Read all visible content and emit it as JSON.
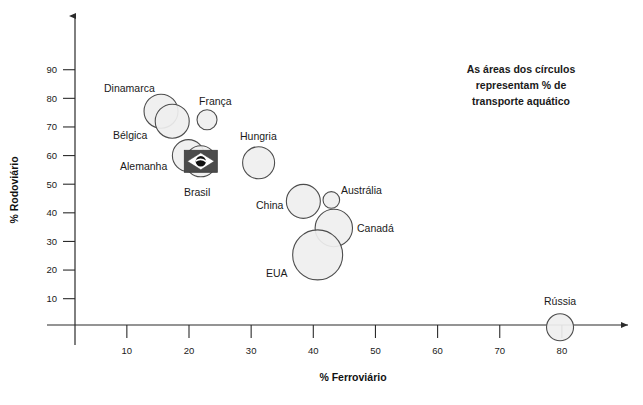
{
  "chart_data": {
    "type": "scatter",
    "title": "",
    "xlabel": "% Ferroviário",
    "ylabel": "% Rodoviário",
    "xlim": [
      0,
      85
    ],
    "ylim": [
      0,
      98
    ],
    "xticks": [
      10,
      20,
      30,
      40,
      50,
      60,
      70,
      80
    ],
    "yticks": [
      10,
      20,
      30,
      40,
      50,
      60,
      70,
      80,
      90
    ],
    "grid": false,
    "legend": "none",
    "annotation": "As áreas dos círculos representam % de transporte aquático",
    "size_meaning": "% de transporte aquático",
    "points": [
      {
        "label": "Dinamarca",
        "x": 15.5,
        "y": 75.5,
        "r": 17.0,
        "label_x": 104,
        "label_y": 92,
        "anchor": "start",
        "highlight": false
      },
      {
        "label": "Bélgica",
        "x": 17.3,
        "y": 72.0,
        "r": 17.0,
        "label_x": 113,
        "label_y": 139,
        "anchor": "start",
        "highlight": false
      },
      {
        "label": "França",
        "x": 22.9,
        "y": 72.5,
        "r": 10.0,
        "label_x": 199,
        "label_y": 105,
        "anchor": "start",
        "highlight": false
      },
      {
        "label": "Alemanha",
        "x": 19.9,
        "y": 60.0,
        "r": 16.0,
        "label_x": 120,
        "label_y": 170,
        "anchor": "start",
        "highlight": false
      },
      {
        "label": "Brasil",
        "x": 21.9,
        "y": 58.0,
        "r": 15.5,
        "label_x": 184,
        "label_y": 196,
        "anchor": "start",
        "highlight": true
      },
      {
        "label": "Hungria",
        "x": 31.2,
        "y": 57.5,
        "r": 16.0,
        "label_x": 240,
        "label_y": 140,
        "anchor": "start",
        "highlight": false
      },
      {
        "label": "China",
        "x": 38.4,
        "y": 44.0,
        "r": 17.0,
        "label_x": 256,
        "label_y": 209,
        "anchor": "start",
        "highlight": false
      },
      {
        "label": "Austrália",
        "x": 42.9,
        "y": 44.5,
        "r": 8.3,
        "label_x": 341,
        "label_y": 194,
        "anchor": "start",
        "highlight": false
      },
      {
        "label": "Canadá",
        "x": 43.3,
        "y": 34.7,
        "r": 18.7,
        "label_x": 357,
        "label_y": 232,
        "anchor": "start",
        "highlight": false
      },
      {
        "label": "EUA",
        "x": 40.7,
        "y": 25.3,
        "r": 25.0,
        "label_x": 266,
        "label_y": 277,
        "anchor": "start",
        "highlight": false
      },
      {
        "label": "Rússia",
        "x": 79.7,
        "y": 0.0,
        "r": 13.5,
        "label_x": 544,
        "label_y": 305,
        "anchor": "start",
        "highlight": false
      }
    ],
    "brazil_flag": {
      "label": "Brasil",
      "green": "#4b4b4b",
      "yellow": "#ffffff",
      "blue": "#111111",
      "band": "#ffffff"
    }
  },
  "annotation_lines": [
    "As áreas dos círculos",
    "representam % de",
    "transporte aquático"
  ],
  "axes": {
    "x_title": "% Ferroviário",
    "y_title": "% Rodoviário",
    "x_tick_labels": [
      "10",
      "20",
      "30",
      "40",
      "50",
      "60",
      "70",
      "80"
    ],
    "y_tick_labels": [
      "10",
      "20",
      "30",
      "40",
      "50",
      "60",
      "70",
      "80",
      "90"
    ]
  },
  "colors": {
    "bubble_fill": "#efefef",
    "bubble_stroke": "#4d4d4d",
    "axis": "#2b2b2b",
    "text": "#1a1a1a",
    "background": "#ffffff"
  }
}
